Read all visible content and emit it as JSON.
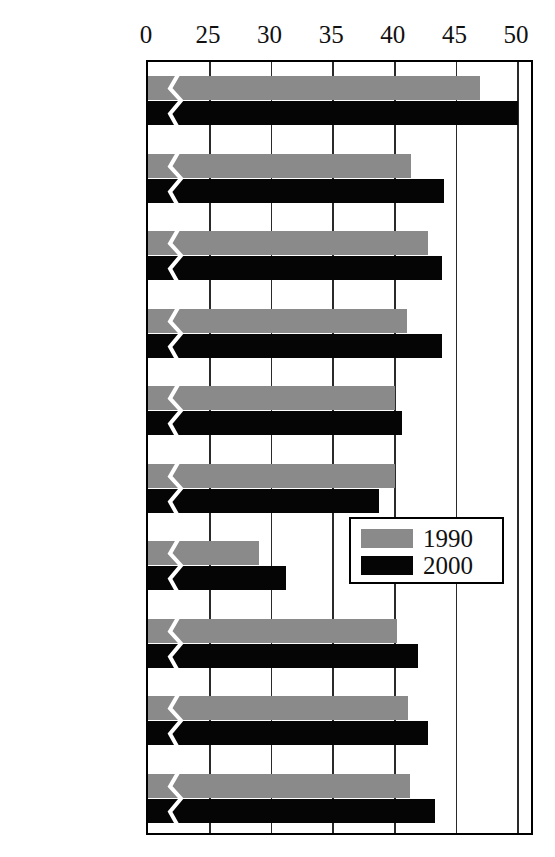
{
  "chart_data": {
    "type": "bar",
    "orientation": "horizontal",
    "title": "",
    "subtitle": "",
    "xlabel": "",
    "ylabel": "",
    "grid": true,
    "legend_position": "inside-right-middle",
    "axis_note": "broken x-axis between 0 and 25",
    "xlim": [
      0,
      50
    ],
    "tick_labels": [
      "0",
      "25",
      "30",
      "35",
      "40",
      "45",
      "50"
    ],
    "tick_values": [
      0,
      25,
      30,
      35,
      40,
      45,
      50
    ],
    "categories": [
      "France",
      "Germany",
      "Canada",
      "Italy",
      "Britain",
      "Japan",
      "United\nStates",
      "G7 average",
      "OECD\naverage",
      "OECD excl\nG7, average"
    ],
    "series": [
      {
        "name": "1990",
        "color": "#8a8a8a",
        "values": [
          46.9,
          41.3,
          42.7,
          41.0,
          40.0,
          40.0,
          29.0,
          40.2,
          41.1,
          41.2
        ]
      },
      {
        "name": "2000",
        "color": "#050505",
        "values": [
          50.0,
          44.0,
          43.8,
          43.8,
          40.6,
          38.7,
          31.2,
          41.9,
          42.7,
          43.3
        ]
      }
    ]
  },
  "legend": {
    "entries": [
      {
        "label": "1990",
        "swatch": "y1990"
      },
      {
        "label": "2000",
        "swatch": "y2000"
      }
    ]
  }
}
